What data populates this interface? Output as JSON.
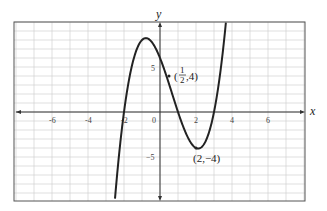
{
  "chart_data": {
    "type": "line",
    "title": "",
    "xlabel": "x",
    "ylabel": "y",
    "xlim": [
      -8,
      8
    ],
    "ylim": [
      -10,
      10
    ],
    "grid": true,
    "x_ticks": [
      -6,
      -4,
      -2,
      0,
      2,
      4,
      6
    ],
    "x_tick_labels": [
      "-6",
      "-4",
      "-2",
      "0",
      "2",
      "4",
      "6"
    ],
    "y_ticks": [
      5,
      -5
    ],
    "y_tick_labels": [
      "5",
      "-5"
    ],
    "series": [
      {
        "name": "f(x)",
        "description": "cubic with zeros near -2, 1, 3; local max near (-0.8, 8.2); local min at (2, -4)",
        "x": [
          -2.4,
          -2,
          -1.5,
          -1,
          -0.8,
          -0.5,
          0,
          0.5,
          1,
          1.5,
          2,
          2.5,
          3,
          3.4
        ],
        "y": [
          -9.9,
          0,
          5.6,
          8,
          8.2,
          7.9,
          6,
          4,
          0,
          -2.6,
          -4,
          -3.4,
          0,
          6.5
        ]
      }
    ],
    "annotations": [
      {
        "label_num": "1",
        "label_den": "2",
        "label_rest": ",4)",
        "label_open": "(",
        "point": [
          0.5,
          4
        ]
      },
      {
        "label": "(2,−4)",
        "point": [
          2,
          -4
        ]
      }
    ]
  },
  "labels": {
    "x_axis": "x",
    "y_axis": "y",
    "tick_neg6": "-6",
    "tick_neg4": "-4",
    "tick_neg2": "-2",
    "tick_0": "0",
    "tick_2": "2",
    "tick_4": "4",
    "tick_6": "6",
    "tick_y5": "5",
    "tick_yneg5": "−5",
    "pt1_open": "(",
    "pt1_num": "1",
    "pt1_den": "2",
    "pt1_rest": ",4)",
    "pt2": "(2,−4)"
  }
}
